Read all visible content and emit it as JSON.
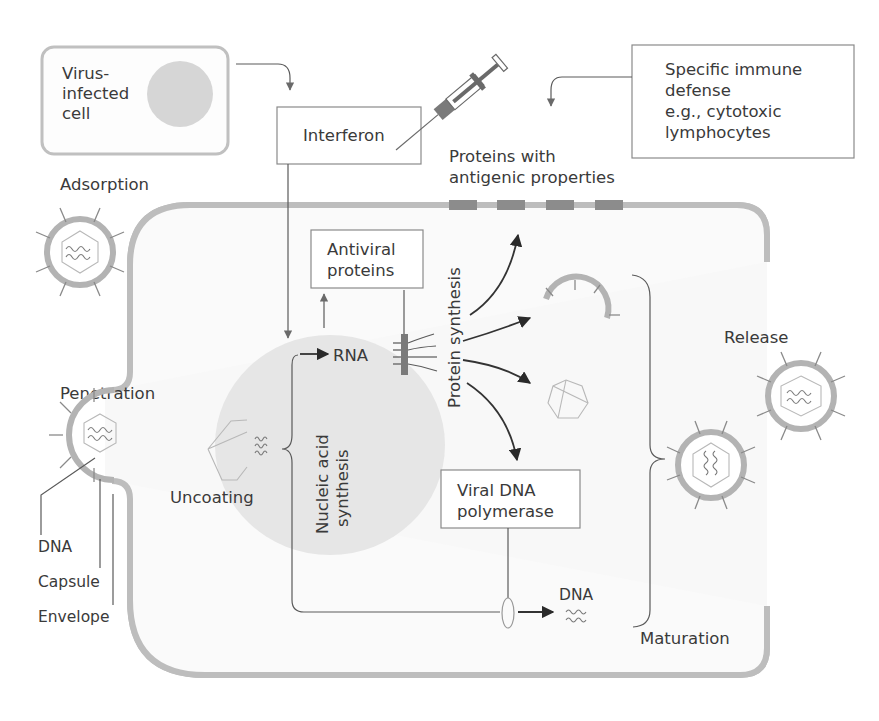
{
  "diagram": {
    "colors": {
      "membrane": "#bdbdbd",
      "nucleus": "#e4e4e4",
      "antigen": "#8c8c8c",
      "arrow": "#333333",
      "box_border": "#8a8a8a"
    },
    "infected_cell": {
      "line1": "Virus-",
      "line2": "infected",
      "line3": "cell"
    },
    "interferon_box": {
      "label": "Interferon"
    },
    "syringe": {
      "icon": "syringe-icon"
    },
    "immune_box": {
      "line1": "Specific immune",
      "line2": "defense",
      "line3": "e.g., cytotoxic",
      "line4": "lymphocytes"
    },
    "antigenic_label": {
      "line1": "Proteins with",
      "line2": "antigenic properties"
    },
    "stages": {
      "adsorption": "Adsorption",
      "penetration": "Penetration",
      "uncoating": "Uncoating",
      "maturation": "Maturation",
      "release": "Release"
    },
    "virion_parts": {
      "dna": "DNA",
      "capsule": "Capsule",
      "envelope": "Envelope"
    },
    "antiviral_box": {
      "line1": "Antiviral",
      "line2": "proteins"
    },
    "rna_label": "RNA",
    "protein_synthesis_label": "Protein synthesis",
    "nucleic_acid_label": {
      "line1": "Nucleic acid",
      "line2": "synthesis"
    },
    "polymerase_box": {
      "line1": "Viral DNA",
      "line2": "polymerase"
    },
    "dna_product_label": "DNA"
  }
}
